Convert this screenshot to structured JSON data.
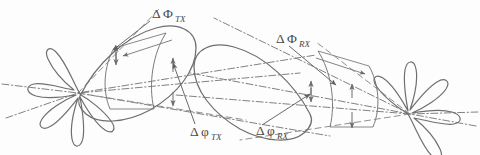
{
  "figure": {
    "background_color": "#fdfdfd",
    "stroke_color": "#6b6b6b",
    "stroke_color_dark": "#555555",
    "label_color": "#4a4a4a"
  },
  "labels": {
    "tx_capital": {
      "delta": "Δ",
      "phi": "Φ",
      "sub": "TX",
      "full": "ΔΦTX"
    },
    "tx_lower": {
      "delta": "Δ",
      "phi": "φ",
      "sub": "TX",
      "full": "ΔφTX"
    },
    "rx_capital": {
      "delta": "Δ",
      "phi": "Φ",
      "sub": "RX",
      "full": "ΔΦRX"
    },
    "rx_lower": {
      "delta": "Δ",
      "phi": "φ",
      "sub": "RX",
      "full": "ΔφRX"
    }
  },
  "annotations": [
    {
      "id": "tx-elevation-offset",
      "name": "delta-phi-capital-tx-label",
      "text_delta": "Δ",
      "text_phi": "Φ",
      "text_sub": "TX",
      "x": 152,
      "y": 16,
      "leader_to_x": 116,
      "leader_to_y": 54
    },
    {
      "id": "tx-azimuth-offset",
      "name": "delta-phi-lower-tx-label",
      "text_delta": "Δ",
      "text_phi": "φ",
      "text_sub": "TX",
      "x": 188,
      "y": 134,
      "leader_to_x": 173,
      "leader_to_y": 62
    },
    {
      "id": "rx-elevation-offset",
      "name": "delta-phi-capital-rx-label",
      "text_delta": "Δ",
      "text_phi": "Φ",
      "text_sub": "RX",
      "x": 277,
      "y": 41,
      "leader_to_x": 330,
      "leader_to_y": 82
    },
    {
      "id": "rx-azimuth-offset",
      "name": "delta-phi-lower-rx-label",
      "text_delta": "Δ",
      "text_phi": "φ",
      "text_sub": "RX",
      "x": 256,
      "y": 133,
      "leader_to_x": 307,
      "leader_to_y": 97
    }
  ],
  "antennas": [
    {
      "id": "tx",
      "name": "tx-antenna-pattern",
      "role": "transmitter",
      "origin_x": 78,
      "origin_y": 93,
      "main_lobe_angle_deg": -28,
      "main_lobe_length": 118,
      "main_lobe_width": 56,
      "side_lobe_count": 7
    },
    {
      "id": "rx",
      "name": "rx-antenna-pattern",
      "role": "receiver",
      "origin_x": 410,
      "origin_y": 114,
      "main_lobe_angle_deg": 197,
      "main_lobe_length": 118,
      "main_lobe_width": 56,
      "side_lobe_count": 7
    }
  ],
  "axes": {
    "tx_rays": [
      {
        "name": "tx-boresight-axis",
        "style": "dash-dot"
      },
      {
        "name": "tx-lower-axis",
        "style": "dash-dot"
      },
      {
        "name": "tx-upper-axis",
        "style": "dash-dot"
      }
    ],
    "rx_rays": [
      {
        "name": "rx-boresight-axis",
        "style": "dash-dot"
      },
      {
        "name": "rx-lower-axis",
        "style": "dash-dot"
      },
      {
        "name": "rx-upper-axis",
        "style": "dash-dot"
      }
    ]
  }
}
